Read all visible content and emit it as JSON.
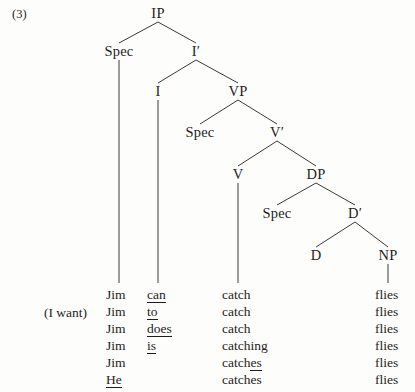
{
  "example": {
    "number": "(3)",
    "gloss": "(I want)"
  },
  "tree": {
    "nodes": [
      {
        "id": "IP",
        "label": "IP",
        "x": 158,
        "y": 14
      },
      {
        "id": "SpecIP",
        "label": "Spec",
        "x": 119,
        "y": 52
      },
      {
        "id": "Ibar",
        "label": "I′",
        "x": 196,
        "y": 52
      },
      {
        "id": "I",
        "label": "I",
        "x": 158,
        "y": 92
      },
      {
        "id": "VP",
        "label": "VP",
        "x": 238,
        "y": 92
      },
      {
        "id": "SpecVP",
        "label": "Spec",
        "x": 200,
        "y": 133
      },
      {
        "id": "Vbar",
        "label": "V′",
        "x": 277,
        "y": 133
      },
      {
        "id": "V",
        "label": "V",
        "x": 238,
        "y": 175
      },
      {
        "id": "DP",
        "label": "DP",
        "x": 316,
        "y": 175
      },
      {
        "id": "SpecDP",
        "label": "Spec",
        "x": 277,
        "y": 214
      },
      {
        "id": "Dbar",
        "label": "D′",
        "x": 355,
        "y": 214
      },
      {
        "id": "D",
        "label": "D",
        "x": 316,
        "y": 256
      },
      {
        "id": "NP",
        "label": "NP",
        "x": 388,
        "y": 256
      }
    ],
    "branches": [
      {
        "from": "IP",
        "to": "SpecIP"
      },
      {
        "from": "IP",
        "to": "Ibar"
      },
      {
        "from": "Ibar",
        "to": "I"
      },
      {
        "from": "Ibar",
        "to": "VP"
      },
      {
        "from": "VP",
        "to": "SpecVP"
      },
      {
        "from": "VP",
        "to": "Vbar"
      },
      {
        "from": "Vbar",
        "to": "V"
      },
      {
        "from": "Vbar",
        "to": "DP"
      },
      {
        "from": "DP",
        "to": "SpecDP"
      },
      {
        "from": "DP",
        "to": "Dbar"
      },
      {
        "from": "Dbar",
        "to": "D"
      },
      {
        "from": "Dbar",
        "to": "NP"
      }
    ],
    "stems": [
      {
        "from": "SpecIP",
        "x": 119,
        "y1": 60,
        "y2": 283
      },
      {
        "from": "I",
        "x": 158,
        "y1": 100,
        "y2": 283
      },
      {
        "from": "V",
        "x": 238,
        "y1": 183,
        "y2": 283
      },
      {
        "from": "NP",
        "x": 388,
        "y1": 264,
        "y2": 283
      }
    ]
  },
  "columns": {
    "spec_x": 106,
    "infl_x": 147,
    "verb_x": 222,
    "np_x": 375,
    "gloss_x": 44,
    "first_row_y": 288,
    "row_height": 17
  },
  "rows": [
    {
      "spec": "Jim",
      "spec_underline": "none",
      "infl": "can",
      "infl_underline": "full",
      "verb": "catch",
      "verb_underline": "none",
      "np": "flies"
    },
    {
      "spec": "Jim",
      "spec_underline": "none",
      "infl": "to",
      "infl_underline": "full",
      "verb": "catch",
      "verb_underline": "none",
      "np": "flies"
    },
    {
      "spec": "Jim",
      "spec_underline": "none",
      "infl": "does",
      "infl_underline": "full",
      "verb": "catch",
      "verb_underline": "none",
      "np": "flies"
    },
    {
      "spec": "Jim",
      "spec_underline": "none",
      "infl": "is",
      "infl_underline": "full",
      "verb": "catching",
      "verb_underline": "none",
      "np": "flies"
    },
    {
      "spec": "Jim",
      "spec_underline": "none",
      "infl": "",
      "infl_underline": "none",
      "verb": "catch",
      "verb_underline": "tail",
      "verb_tail": "es",
      "np": "flies"
    },
    {
      "spec": "He",
      "spec_underline": "full",
      "infl": "",
      "infl_underline": "none",
      "verb": "catches",
      "verb_underline": "none",
      "np": "flies"
    }
  ],
  "style": {
    "line_color": "#3a3a3a",
    "text_color": "#1d1d1d",
    "background": "#fdfdfc"
  }
}
